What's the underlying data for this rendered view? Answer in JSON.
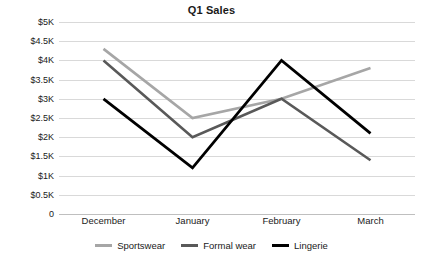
{
  "chart_data": {
    "type": "line",
    "title": "Q1 Sales",
    "xlabel": "",
    "ylabel": "",
    "categories": [
      "December",
      "January",
      "February",
      "March"
    ],
    "series": [
      {
        "name": "Sportswear",
        "color": "#a6a6a6",
        "width": 2.6,
        "values": [
          4300,
          2500,
          3000,
          3800
        ]
      },
      {
        "name": "Formal wear",
        "color": "#595959",
        "width": 2.6,
        "values": [
          4000,
          2000,
          3000,
          1400
        ]
      },
      {
        "name": "Lingerie",
        "color": "#000000",
        "width": 2.8,
        "values": [
          3000,
          1200,
          4000,
          2100
        ]
      }
    ],
    "ylim": [
      0,
      5000
    ],
    "ytick_values": [
      5000,
      4500,
      4000,
      3500,
      3000,
      2500,
      2000,
      1500,
      1000,
      500,
      0
    ],
    "ytick_labels": [
      "$5K",
      "$4.5K",
      "$4K",
      "$3.5K",
      "$3K",
      "$2.5K",
      "$2K",
      "$1.5K",
      "$1K",
      "$0.5K",
      "0"
    ],
    "grid": true,
    "grid_color": "#d9d9d9",
    "legend_position": "bottom"
  }
}
